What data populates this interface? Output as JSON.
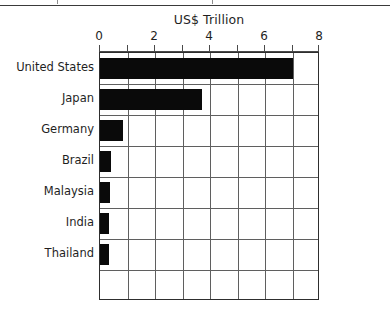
{
  "page": {
    "has_top_rule": true
  },
  "chart_data": {
    "type": "bar",
    "orientation": "horizontal",
    "title": "US$ Trillion",
    "xlabel": "",
    "ylabel": "",
    "categories": [
      "United States",
      "Japan",
      "Germany",
      "Brazil",
      "Malaysia",
      "India",
      "Thailand"
    ],
    "values": [
      7.0,
      3.7,
      0.85,
      0.4,
      0.35,
      0.33,
      0.33
    ],
    "xlim": [
      0,
      8
    ],
    "xticks": [
      0,
      1,
      2,
      3,
      4,
      5,
      6,
      7,
      8
    ],
    "xtick_labels": [
      "0",
      "",
      "2",
      "",
      "4",
      "",
      "6",
      "",
      "8"
    ],
    "grid": true,
    "legend": null,
    "bar_color": "#0a0a0a",
    "grid_color": "#5f5f5f",
    "frame_color": "#2e2e2e"
  }
}
